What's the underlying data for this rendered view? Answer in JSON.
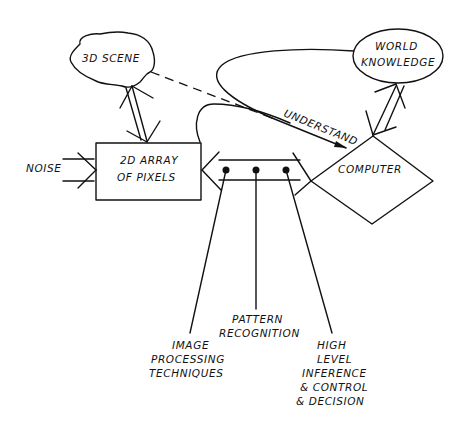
{
  "diagram": {
    "title": "",
    "colors": {
      "ink": "#111111",
      "background": "#ffffff"
    },
    "nodes": {
      "scene": {
        "label": "3D SCENE",
        "shape": "cloud"
      },
      "pixels": {
        "label_line1": "2D ARRAY",
        "label_line2": "OF PIXELS",
        "shape": "rectangle"
      },
      "computer": {
        "label": "COMPUTER",
        "shape": "diamond"
      },
      "knowledge": {
        "label_line1": "WORLD",
        "label_line2": "KNOWLEDGE",
        "shape": "ellipse"
      }
    },
    "inputs": {
      "noise": {
        "label": "NOISE"
      }
    },
    "edges": {
      "understand": {
        "label": "UNDERSTAND",
        "from": "computer",
        "to": "scene",
        "style": "dashed+solid"
      },
      "scene_pixels": {
        "from": "scene",
        "to": "pixels",
        "style": "double-arrow"
      },
      "pixels_computer": {
        "from": "pixels",
        "to": "computer",
        "style": "double-arrow"
      },
      "computer_knowledge": {
        "from": "computer",
        "to": "knowledge",
        "style": "double-arrow"
      },
      "noise_pixels": {
        "from": "noise",
        "to": "pixels",
        "style": "arrow"
      }
    },
    "annotations": [
      {
        "id": "image-processing",
        "lines": [
          "IMAGE",
          "PROCESSING",
          "TECHNIQUES"
        ]
      },
      {
        "id": "pattern-recognition",
        "lines": [
          "PATTERN",
          "RECOGNITION"
        ]
      },
      {
        "id": "high-level",
        "lines": [
          "HIGH",
          "LEVEL",
          "INFERENCE",
          "& CONTROL",
          "& DECISION"
        ]
      }
    ]
  }
}
